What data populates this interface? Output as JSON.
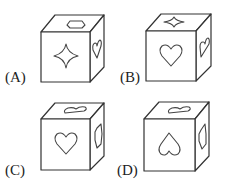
{
  "figure": {
    "options": [
      {
        "label": "(A)",
        "front": "four-point-star",
        "top": "hexagon",
        "right": "heart"
      },
      {
        "label": "(B)",
        "front": "heart",
        "top": "four-point-star",
        "right": "heart"
      },
      {
        "label": "(C)",
        "front": "heart",
        "top": "heart",
        "right": "hexagon"
      },
      {
        "label": "(D)",
        "front": "inverted-heart",
        "top": "heart",
        "right": "hexagon"
      }
    ]
  }
}
